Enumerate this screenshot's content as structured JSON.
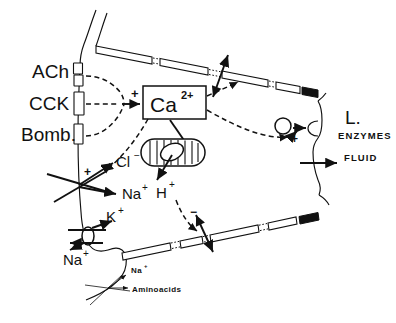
{
  "figure": {
    "ligands": [
      {
        "name": "ach",
        "label": "ACh"
      },
      {
        "name": "cck",
        "label": "CCK"
      },
      {
        "name": "bomb",
        "label": "Bomb."
      }
    ],
    "messenger": {
      "base": "Ca",
      "superscript": "2+",
      "activation_sign": "+"
    },
    "mitochondrion": {
      "efflux_base": "H",
      "efflux_superscript": "+"
    },
    "ions": [
      {
        "name": "chloride",
        "base": "Cl",
        "superscript": "−"
      },
      {
        "name": "sodium-apical",
        "base": "Na",
        "superscript": "+"
      },
      {
        "name": "potassium",
        "base": "K",
        "superscript": "+"
      },
      {
        "name": "sodium-pump",
        "base": "Na",
        "superscript": "+"
      }
    ],
    "cotransport": {
      "sodium_base": "Na",
      "sodium_superscript": "+",
      "aminoacids_label": "Aminoacids"
    },
    "lumen": {
      "l_label": "L.",
      "enzymes_label": "ENZYMES",
      "fluid_label": "FLUID"
    },
    "signs": {
      "plus_ca": "+",
      "plus_chloride": "+",
      "plus_exocytosis": "+",
      "minus_tubule": "−"
    },
    "colors": {
      "ink": "#111111",
      "paper": "#ffffff"
    }
  }
}
